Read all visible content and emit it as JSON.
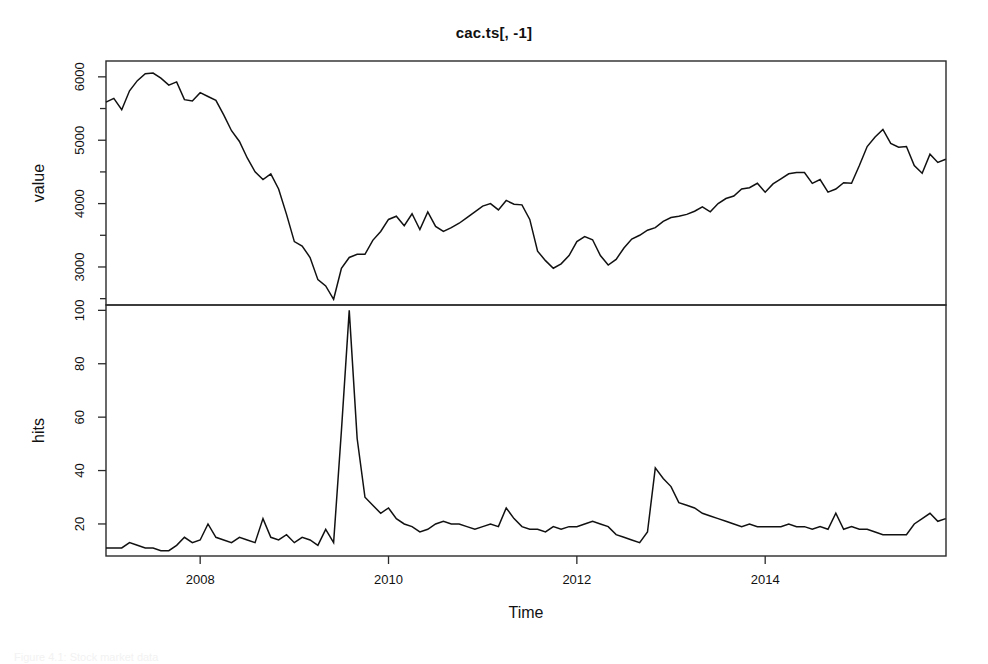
{
  "figure": {
    "title": "cac.ts[, -1]",
    "caption": "Figure 4.1: Stock market data",
    "background_color": "#ffffff",
    "line_color": "#111111",
    "axis_color": "#2a2a2a"
  },
  "chart_data": {
    "type": "line",
    "title": "cac.ts[, -1]",
    "xlabel": "Time",
    "grid": false,
    "legend": "none",
    "panels": [
      {
        "name": "value-panel",
        "ylabel": "value",
        "ylim": [
          2400,
          6250
        ],
        "yticks": [
          3000,
          4000,
          5000,
          6000
        ],
        "yticks_minor": [
          2500,
          3500,
          4500,
          5500
        ],
        "ytick_labels": [
          "3000",
          "4000",
          "5000",
          "6000"
        ],
        "xlim": [
          2007.0,
          2015.92
        ],
        "x": [
          2007.0,
          2007.083,
          2007.167,
          2007.25,
          2007.333,
          2007.417,
          2007.5,
          2007.583,
          2007.667,
          2007.75,
          2007.833,
          2007.917,
          2008.0,
          2008.083,
          2008.167,
          2008.25,
          2008.333,
          2008.417,
          2008.5,
          2008.583,
          2008.667,
          2008.75,
          2008.833,
          2008.917,
          2009.0,
          2009.083,
          2009.167,
          2009.25,
          2009.333,
          2009.417,
          2009.5,
          2009.583,
          2009.667,
          2009.75,
          2009.833,
          2009.917,
          2010.0,
          2010.083,
          2010.167,
          2010.25,
          2010.333,
          2010.417,
          2010.5,
          2010.583,
          2010.667,
          2010.75,
          2010.833,
          2010.917,
          2011.0,
          2011.083,
          2011.167,
          2011.25,
          2011.333,
          2011.417,
          2011.5,
          2011.583,
          2011.667,
          2011.75,
          2011.833,
          2011.917,
          2012.0,
          2012.083,
          2012.167,
          2012.25,
          2012.333,
          2012.417,
          2012.5,
          2012.583,
          2012.667,
          2012.75,
          2012.833,
          2012.917,
          2013.0,
          2013.083,
          2013.167,
          2013.25,
          2013.333,
          2013.417,
          2013.5,
          2013.583,
          2013.667,
          2013.75,
          2013.833,
          2013.917,
          2014.0,
          2014.083,
          2014.167,
          2014.25,
          2014.333,
          2014.417,
          2014.5,
          2014.583,
          2014.667,
          2014.75,
          2014.833,
          2014.917,
          2015.0,
          2015.083,
          2015.167,
          2015.25,
          2015.333,
          2015.417,
          2015.5,
          2015.583,
          2015.667,
          2015.75,
          2015.833,
          2015.917
        ],
        "values": [
          5600,
          5660,
          5480,
          5780,
          5940,
          6050,
          6060,
          5980,
          5870,
          5920,
          5640,
          5620,
          5750,
          5690,
          5630,
          5400,
          5150,
          4980,
          4720,
          4500,
          4380,
          4470,
          4230,
          3830,
          3400,
          3330,
          3150,
          2800,
          2700,
          2490,
          2980,
          3150,
          3200,
          3200,
          3420,
          3560,
          3750,
          3800,
          3650,
          3840,
          3590,
          3870,
          3640,
          3560,
          3620,
          3690,
          3780,
          3870,
          3960,
          4000,
          3900,
          4050,
          3990,
          3980,
          3750,
          3250,
          3100,
          2980,
          3050,
          3180,
          3400,
          3480,
          3430,
          3180,
          3030,
          3120,
          3300,
          3440,
          3500,
          3580,
          3620,
          3720,
          3780,
          3800,
          3830,
          3880,
          3950,
          3870,
          4000,
          4080,
          4120,
          4230,
          4250,
          4320,
          4180,
          4310,
          4390,
          4470,
          4490,
          4490,
          4320,
          4380,
          4180,
          4230,
          4330,
          4320,
          4600,
          4900,
          5050,
          5170,
          4950,
          4890,
          4900,
          4600,
          4480,
          4780,
          4650,
          4700
        ]
      },
      {
        "name": "hits-panel",
        "ylabel": "hits",
        "ylim": [
          8,
          102
        ],
        "yticks": [
          20,
          40,
          60,
          80,
          100
        ],
        "ytick_labels": [
          "20",
          "40",
          "60",
          "80",
          "100"
        ],
        "xlim": [
          2007.0,
          2015.92
        ],
        "x": [
          2007.0,
          2007.083,
          2007.167,
          2007.25,
          2007.333,
          2007.417,
          2007.5,
          2007.583,
          2007.667,
          2007.75,
          2007.833,
          2007.917,
          2008.0,
          2008.083,
          2008.167,
          2008.25,
          2008.333,
          2008.417,
          2008.5,
          2008.583,
          2008.667,
          2008.75,
          2008.833,
          2008.917,
          2009.0,
          2009.083,
          2009.167,
          2009.25,
          2009.333,
          2009.417,
          2009.5,
          2009.583,
          2009.667,
          2009.75,
          2009.833,
          2009.917,
          2010.0,
          2010.083,
          2010.167,
          2010.25,
          2010.333,
          2010.417,
          2010.5,
          2010.583,
          2010.667,
          2010.75,
          2010.833,
          2010.917,
          2011.0,
          2011.083,
          2011.167,
          2011.25,
          2011.333,
          2011.417,
          2011.5,
          2011.583,
          2011.667,
          2011.75,
          2011.833,
          2011.917,
          2012.0,
          2012.083,
          2012.167,
          2012.25,
          2012.333,
          2012.417,
          2012.5,
          2012.583,
          2012.667,
          2012.75,
          2012.833,
          2012.917,
          2013.0,
          2013.083,
          2013.167,
          2013.25,
          2013.333,
          2013.417,
          2013.5,
          2013.583,
          2013.667,
          2013.75,
          2013.833,
          2013.917,
          2014.0,
          2014.083,
          2014.167,
          2014.25,
          2014.333,
          2014.417,
          2014.5,
          2014.583,
          2014.667,
          2014.75,
          2014.833,
          2014.917,
          2015.0,
          2015.083,
          2015.167,
          2015.25,
          2015.333,
          2015.417,
          2015.5,
          2015.583,
          2015.667,
          2015.75,
          2015.833,
          2015.917
        ],
        "values": [
          11,
          11,
          11,
          13,
          12,
          11,
          11,
          10,
          10,
          12,
          15,
          13,
          14,
          20,
          15,
          14,
          13,
          15,
          14,
          13,
          22,
          15,
          14,
          16,
          13,
          15,
          14,
          12,
          18,
          13,
          55,
          100,
          52,
          30,
          27,
          24,
          26,
          22,
          20,
          19,
          17,
          18,
          20,
          21,
          20,
          20,
          19,
          18,
          19,
          20,
          19,
          26,
          22,
          19,
          18,
          18,
          17,
          19,
          18,
          19,
          19,
          20,
          21,
          20,
          19,
          16,
          15,
          14,
          13,
          17,
          41,
          37,
          34,
          28,
          27,
          26,
          24,
          23,
          22,
          21,
          20,
          19,
          20,
          19,
          19,
          19,
          19,
          20,
          19,
          19,
          18,
          19,
          18,
          24,
          18,
          19,
          18,
          18,
          17,
          16,
          16,
          16,
          16,
          20,
          22,
          24,
          21,
          22
        ]
      }
    ],
    "xticks": [
      2008,
      2010,
      2012,
      2014,
      2016
    ],
    "xtick_labels": [
      "2008",
      "2010",
      "2012",
      "2014",
      "2016"
    ]
  }
}
